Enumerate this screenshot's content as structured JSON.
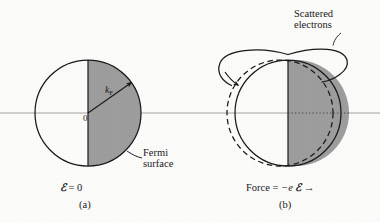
{
  "figure": {
    "kind": "physics-diagram",
    "background_color": "#fdfdfc",
    "ink_color": "#1a1a1a",
    "shade_color": "#9e9e9e",
    "axis_color": "#9a9a9a"
  },
  "axis": {
    "name": "horizontal k-axis",
    "y": 113,
    "x_start": 0,
    "x_end": 380
  },
  "panel_a": {
    "caption": "(a)",
    "field_label": "ℰ = 0",
    "field_symbol": "ℰ",
    "field_value": "0",
    "origin_label": "0",
    "vector_label": "k",
    "vector_subscript": "F",
    "annotation": "Fermi\nsurface",
    "annotation_line1": "Fermi",
    "annotation_line2": "surface",
    "circle": {
      "cx": 88,
      "cy": 113,
      "r": 53
    },
    "shaded_half": "right"
  },
  "panel_b": {
    "caption": "(b)",
    "force_label": "Force = −e ℰ",
    "force_prefix": "Force = ",
    "force_charge": "−e",
    "force_field_symbol": "ℰ",
    "force_arrow_glyph": "→",
    "annotation_line1": "Scattered",
    "annotation_line2": "electrons",
    "solid_circle": {
      "cx": 288,
      "cy": 113,
      "r": 53
    },
    "dashed_circle": {
      "cx": 280,
      "cy": 113,
      "r": 53
    },
    "displacement_px": 8,
    "shaded_half": "right",
    "scatter_arrow": "loop over top, arrowhead down-left"
  }
}
